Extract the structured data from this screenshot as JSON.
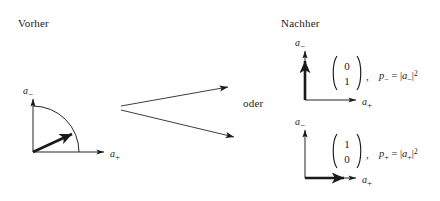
{
  "figure": {
    "type": "quantum-measurement-collapse-diagram",
    "language": "de",
    "background_color": "#ffffff",
    "ink_color": "#1a1a1a"
  },
  "captions": {
    "before": "Vorher",
    "after": "Nachher",
    "connector": "oder"
  },
  "axes": {
    "horizontal_base": "a",
    "horizontal_sub": "+",
    "vertical_base": "a",
    "vertical_sub": "−"
  },
  "before_panel": {
    "name": "superposition-state",
    "arc": "quarter-circle",
    "vector": "diagonal-state-vector",
    "vertical_axis_label": "a",
    "vertical_axis_sub": "−",
    "horizontal_axis_label": "a",
    "horizontal_axis_sub": "+"
  },
  "branches": [
    {
      "name": "branch-upper",
      "target": "outcome-minus"
    },
    {
      "name": "branch-lower",
      "target": "outcome-plus"
    }
  ],
  "outcomes": [
    {
      "name": "outcome-minus",
      "vector_top": "0",
      "vector_bottom": "1",
      "separator": ",",
      "prob_symbol": "p",
      "prob_sub": "−",
      "equals": "=",
      "amp_open": "|",
      "amp_base": "a",
      "amp_sub": "−",
      "amp_close": "|",
      "exponent": "2",
      "vertical_axis_label": "a",
      "vertical_axis_sub": "−",
      "horizontal_axis_label": "a",
      "horizontal_axis_sub": "+",
      "collapsed_direction": "vertical"
    },
    {
      "name": "outcome-plus",
      "vector_top": "1",
      "vector_bottom": "0",
      "separator": ",",
      "prob_symbol": "p",
      "prob_sub": "+",
      "equals": "=",
      "amp_open": "|",
      "amp_base": "a",
      "amp_sub": "+",
      "amp_close": "|",
      "exponent": "2",
      "vertical_axis_label": "a",
      "vertical_axis_sub": "−",
      "horizontal_axis_label": "a",
      "horizontal_axis_sub": "+",
      "collapsed_direction": "horizontal"
    }
  ]
}
